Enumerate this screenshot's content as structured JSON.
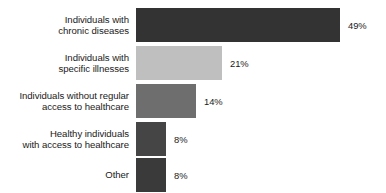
{
  "chart_data": {
    "type": "bar",
    "orientation": "horizontal",
    "title": "",
    "subtitle": "",
    "xlabel": "",
    "ylabel": "",
    "grid": false,
    "legend": null,
    "xlim": [
      0,
      49
    ],
    "value_suffix": "%",
    "categories": [
      "Individuals with chronic diseases",
      "Individuals with specific illnesses",
      "Individuals without regular access to healthcare",
      "Healthy individuals with access to healthcare",
      "Other"
    ],
    "values": [
      49,
      21,
      14,
      8,
      8
    ],
    "bars": [
      {
        "label_lines": [
          "Individuals with",
          "chronic diseases"
        ],
        "value": 49,
        "value_label": "49%",
        "color": "#333333",
        "width_px": 204
      },
      {
        "label_lines": [
          "Individuals with",
          "specific illnesses"
        ],
        "value": 21,
        "value_label": "21%",
        "color": "#bfbfbf",
        "width_px": 86
      },
      {
        "label_lines": [
          "Individuals without regular",
          "access to healthcare"
        ],
        "value": 14,
        "value_label": "14%",
        "color": "#6e6e6e",
        "width_px": 60
      },
      {
        "label_lines": [
          "Healthy individuals",
          "with access to healthcare"
        ],
        "value": 8,
        "value_label": "8%",
        "color": "#454545",
        "width_px": 30
      },
      {
        "label_lines": [
          "Other"
        ],
        "value": 8,
        "value_label": "8%",
        "color": "#3a3a3a",
        "width_px": 30
      }
    ]
  }
}
